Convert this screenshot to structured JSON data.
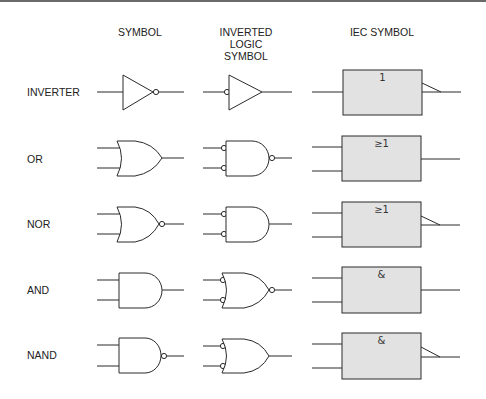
{
  "headers": {
    "symbol": "SYMBOL",
    "inverted": [
      "INVERTED",
      "LOGIC",
      "SYMBOL"
    ],
    "iec": "IEC SYMBOL"
  },
  "rows": [
    {
      "label": "INVERTER",
      "iec_label": "1",
      "iec_inverted_output": true
    },
    {
      "label": "OR",
      "iec_label": "≥1",
      "iec_inverted_output": false
    },
    {
      "label": "NOR",
      "iec_label": "≥1",
      "iec_inverted_output": true
    },
    {
      "label": "AND",
      "iec_label": "&",
      "iec_inverted_output": false
    },
    {
      "label": "NAND",
      "iec_label": "&",
      "iec_inverted_output": true
    }
  ],
  "colors": {
    "line": "#2a2a2a",
    "iec_fill": "#e2e2e2",
    "top_bar": "#6a6a6a"
  }
}
